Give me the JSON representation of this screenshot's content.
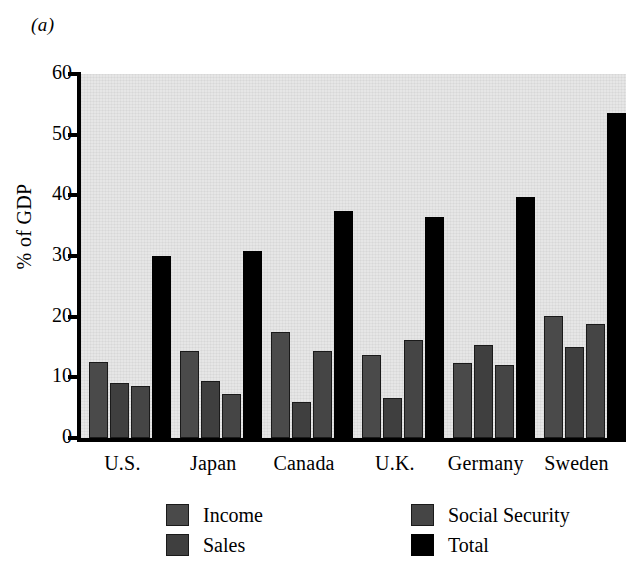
{
  "figure": {
    "panel_label": "(a)"
  },
  "chart_data": {
    "type": "bar",
    "title": "",
    "subtitle": "",
    "xlabel": "",
    "ylabel": "% of GDP",
    "categories": [
      "U.S.",
      "Japan",
      "Canada",
      "U.K.",
      "Germany",
      "Sweden"
    ],
    "series": [
      {
        "name": "Income",
        "values": [
          12.5,
          14.3,
          17.4,
          13.7,
          12.4,
          20.1
        ]
      },
      {
        "name": "Sales",
        "values": [
          9.0,
          9.4,
          6.0,
          6.6,
          15.3,
          15.0
        ]
      },
      {
        "name": "Social Security",
        "values": [
          8.5,
          7.3,
          14.3,
          16.2,
          12.0,
          18.8
        ]
      },
      {
        "name": "Total",
        "values": [
          30.0,
          30.8,
          37.4,
          36.4,
          39.8,
          53.5
        ]
      }
    ],
    "ylim": [
      0,
      60
    ],
    "yticks": [
      0,
      10,
      20,
      30,
      40,
      50,
      60
    ],
    "ytick_labels": [
      "0",
      "10",
      "20",
      "30",
      "40",
      "50",
      "60"
    ],
    "grid": false,
    "legend": {
      "position": "bottom",
      "entries": [
        {
          "label": "Income",
          "color": "#4a4a4a"
        },
        {
          "label": "Sales",
          "color": "#3f3f3f"
        },
        {
          "label": "Social Security",
          "color": "#454545"
        },
        {
          "label": "Total",
          "color": "#000000"
        }
      ]
    },
    "colors": {
      "plot_background": "#e6e6e6",
      "axis": "#000000",
      "income": "#4a4a4a",
      "sales": "#3f3f3f",
      "social_security": "#454545",
      "total": "#000000"
    }
  }
}
